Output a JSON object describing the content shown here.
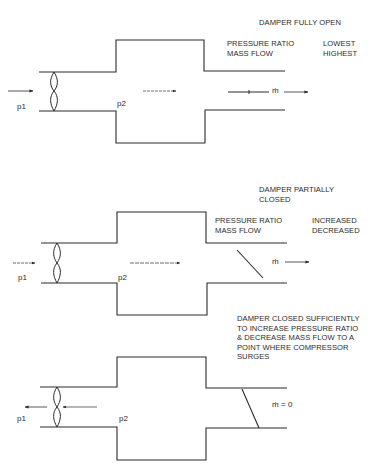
{
  "panels": [
    {
      "title_lines": [
        "DAMPER FULLY OPEN"
      ],
      "param_labels": [
        "PRESSURE RATIO",
        "MASS FLOW"
      ],
      "param_values": [
        "LOWEST",
        "HIGHEST"
      ],
      "inlet_label": "p1",
      "plenum_label": "p2",
      "flow_label": "ṁ",
      "damper_state": "open",
      "flow_direction": "forward"
    },
    {
      "title_lines": [
        "DAMPER PARTIALLY",
        "CLOSED"
      ],
      "param_labels": [
        "PRESSURE RATIO",
        "MASS FLOW"
      ],
      "param_values": [
        "INCREASED",
        "DECREASED"
      ],
      "inlet_label": "p1",
      "plenum_label": "p2",
      "flow_label": "ṁ",
      "damper_state": "partially-closed",
      "flow_direction": "forward"
    },
    {
      "title_lines": [
        "DAMPER CLOSED SUFFICIENTLY",
        "TO INCREASE PRESSURE RATIO",
        "& DECREASE MASS FLOW TO A",
        "POINT WHERE COMPRESSOR",
        "SURGES"
      ],
      "inlet_label": "p1",
      "plenum_label": "p2",
      "flow_label": "ṁ = 0",
      "damper_state": "closed-sufficiently",
      "flow_direction": "reverse"
    }
  ],
  "colors": {
    "ink": "#2b2b2b",
    "background": "#ffffff"
  }
}
